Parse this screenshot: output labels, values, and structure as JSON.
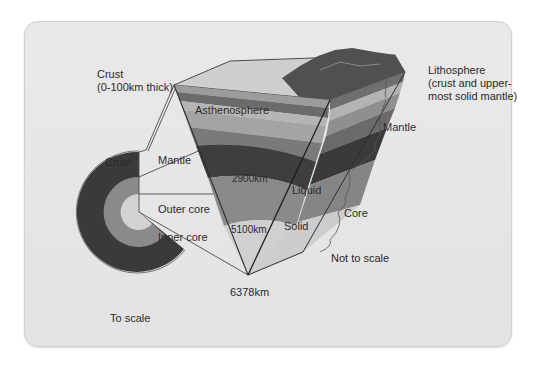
{
  "diagram": {
    "labels": {
      "crust_top": "Crust",
      "crust_thickness": "(0-100km thick)",
      "lithosphere_line1": "Lithosphere",
      "lithosphere_line2": "(crust and upper-",
      "lithosphere_line3": "most solid mantle)",
      "asthenosphere": "Asthenosphere",
      "mantle_right": "Mantle",
      "crust_left": "Crust",
      "mantle_left": "Mantle",
      "depth_2900": "2900km",
      "liquid": "Liquid",
      "core": "Core",
      "outer_core": "Outer core",
      "depth_5100": "5100km",
      "solid": "Solid",
      "inner_core": "Inner core",
      "not_to_scale": "Not to scale",
      "depth_6378": "6378km",
      "to_scale": "To scale"
    },
    "layers": [
      {
        "name": "Crust",
        "depth_km": "0-100",
        "color": "#9a9a9a"
      },
      {
        "name": "Lithosphere",
        "color": "#6e6e6e"
      },
      {
        "name": "Asthenosphere",
        "color": "#a8a8a8"
      },
      {
        "name": "Mantle",
        "depth_km": "2900",
        "color": "#3f3f3f"
      },
      {
        "name": "Outer core",
        "state": "Liquid",
        "depth_km": "5100",
        "color": "#8c8c8c"
      },
      {
        "name": "Inner core",
        "state": "Solid",
        "depth_km": "6378",
        "color": "#cfcfcf"
      }
    ]
  }
}
